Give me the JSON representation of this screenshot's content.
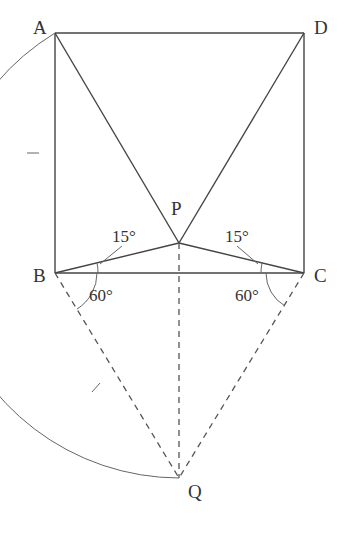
{
  "figure": {
    "points": {
      "A": "A",
      "B": "B",
      "C": "C",
      "D": "D",
      "P": "P",
      "Q": "Q"
    },
    "angles": {
      "PBC": "15°",
      "PCB": "15°",
      "QBC": "60°",
      "QCB": "60°"
    },
    "segments": {
      "solid": [
        "AB",
        "BC",
        "CD",
        "DA",
        "AP",
        "DP",
        "BP",
        "CP"
      ],
      "dashed": [
        "BQ",
        "CQ",
        "PQ"
      ],
      "arc": "AQ (centered at B, radius BA)"
    }
  }
}
